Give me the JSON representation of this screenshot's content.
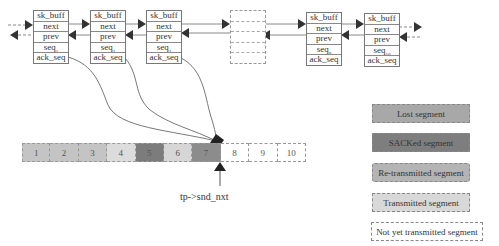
{
  "diagram": {
    "nodes": [
      {
        "id": "skb1",
        "fields": [
          "sk_buff",
          "next",
          "prev",
          "seq",
          "ack_seq"
        ],
        "seq_sub": "1"
      },
      {
        "id": "skb2",
        "fields": [
          "sk_buff",
          "next",
          "prev",
          "seq",
          "ack_seq"
        ],
        "seq_sub": "2"
      },
      {
        "id": "skb3",
        "fields": [
          "sk_buff",
          "next",
          "prev",
          "seq",
          "ack_seq"
        ],
        "seq_sub": "3"
      },
      {
        "id": "skb-ellipsis",
        "fields": [
          "",
          "",
          "",
          "",
          ""
        ],
        "seq_sub": ""
      },
      {
        "id": "skb9",
        "fields": [
          "sk_buff",
          "next",
          "prev",
          "seq",
          "ack_seq"
        ],
        "seq_sub": "9"
      },
      {
        "id": "skb10",
        "fields": [
          "sk_buff",
          "next",
          "prev",
          "seq",
          "ack_seq"
        ],
        "seq_sub": "10"
      }
    ],
    "segments": [
      {
        "label": "1",
        "state": "transmitted",
        "color": "#c4c4c4"
      },
      {
        "label": "2",
        "state": "transmitted",
        "color": "#c4c4c4"
      },
      {
        "label": "3",
        "state": "transmitted",
        "color": "#c4c4c4"
      },
      {
        "label": "4",
        "state": "transmitted",
        "color": "#dcdcdc"
      },
      {
        "label": "5",
        "state": "sacked",
        "color": "#7c7c7c"
      },
      {
        "label": "6",
        "state": "transmitted",
        "color": "#d6d6d6"
      },
      {
        "label": "7",
        "state": "sacked",
        "color": "#8c8c8c"
      },
      {
        "label": "8",
        "state": "not-yet-transmitted",
        "color": "#ffffff"
      },
      {
        "label": "9",
        "state": "not-yet-transmitted",
        "color": "#ffffff"
      },
      {
        "label": "10",
        "state": "not-yet-transmitted",
        "color": "#ffffff"
      }
    ],
    "pointer_label": "tp->snd_nxt",
    "legend": [
      {
        "label": "Lost segment",
        "color": "#a8a8a8"
      },
      {
        "label": "SACKed segment",
        "color": "#7e7e7e"
      },
      {
        "label": "Re-transmitted segment",
        "color": "#b4b4b4"
      },
      {
        "label": "Transmitted segment",
        "color": "#d8d8d8"
      },
      {
        "label": "Not yet transmitted segment",
        "color": "#ffffff"
      }
    ]
  }
}
